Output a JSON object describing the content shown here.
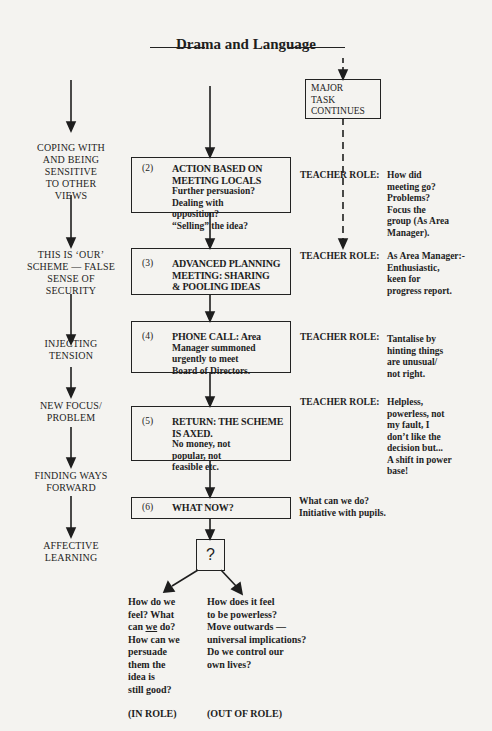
{
  "title": "Drama and Language",
  "left_column": [
    {
      "label": "COPING WITH AND BEING SENSITIVE TO OTHER VIEWS",
      "lines": [
        "COPING WITH",
        "AND BEING",
        "SENSITIVE",
        "TO OTHER",
        "VIEWS"
      ]
    },
    {
      "label": "THIS IS 'OUR' SCHEME — FALSE SENSE OF SECURITY",
      "lines": [
        "THIS IS ‘OUR’",
        "SCHEME — FALSE",
        "SENSE OF",
        "SECURITY"
      ]
    },
    {
      "label": "INJECTING TENSION",
      "lines": [
        "INJECTING",
        "TENSION"
      ]
    },
    {
      "label": "NEW FOCUS/ PROBLEM",
      "lines": [
        "NEW FOCUS/",
        "PROBLEM"
      ]
    },
    {
      "label": "FINDING WAYS FORWARD",
      "lines": [
        "FINDING WAYS",
        "FORWARD"
      ]
    },
    {
      "label": "AFFECTIVE LEARNING",
      "lines": [
        "AFFECTIVE",
        "LEARNING"
      ]
    }
  ],
  "major_task": {
    "lines": [
      "MAJOR",
      "TASK",
      "CONTINUES"
    ]
  },
  "steps": [
    {
      "number": "(2)",
      "heading": [
        "ACTION BASED ON",
        "MEETING LOCALS"
      ],
      "body": [
        "Further persuasion?",
        "Dealing with",
        "opposition?",
        "“Selling” the idea?"
      ]
    },
    {
      "number": "(3)",
      "heading": [
        "ADVANCED PLANNING",
        "MEETING: SHARING",
        "& POOLING IDEAS"
      ],
      "body": []
    },
    {
      "number": "(4)",
      "heading": [
        "PHONE CALL: Area"
      ],
      "body": [
        "Manager summoned",
        "urgently to meet",
        "Board of Directors."
      ]
    },
    {
      "number": "(5)",
      "heading": [
        "RETURN: THE SCHEME",
        "IS AXED."
      ],
      "body": [
        "No money, not",
        "popular, not",
        "feasible etc."
      ]
    },
    {
      "number": "(6)",
      "heading": [
        "WHAT NOW?"
      ],
      "body": []
    }
  ],
  "teacher_label": "TEACHER ROLE:",
  "teacher_roles": [
    {
      "step": "(2)",
      "note": [
        "How did",
        "meeting go?",
        "Problems?",
        "Focus the",
        "group (As Area",
        "Manager)."
      ]
    },
    {
      "step": "(3)",
      "note": [
        "As Area Manager:-",
        "Enthusiastic,",
        "keen for",
        "progress report."
      ]
    },
    {
      "step": "(4)",
      "note": [
        "Tantalise by",
        "hinting things",
        "are unusual/",
        "not right."
      ]
    },
    {
      "step": "(5)",
      "note": [
        "Helpless,",
        "powerless, not",
        "my fault, I",
        "don’t like the",
        "decision but...",
        "A shift in power",
        "base!"
      ]
    }
  ],
  "step6_note": [
    "What can we do?",
    "Initiative with pupils."
  ],
  "decision": {
    "symbol": "?"
  },
  "branches": {
    "in_role": {
      "lines_before": [
        "How do we",
        "feel? What"
      ],
      "can_prefix": "can ",
      "can_underlined": "we",
      "can_suffix": " do?",
      "lines_after": [
        "How can we",
        "persuade",
        "them the",
        "idea is",
        "still good?"
      ],
      "caption": "(IN ROLE)"
    },
    "out_of_role": {
      "lines": [
        "How does it feel",
        "to be powerless?",
        "Move outwards —",
        "universal implications?",
        "Do we control our",
        "own lives?"
      ],
      "caption": "(OUT OF ROLE)"
    }
  }
}
